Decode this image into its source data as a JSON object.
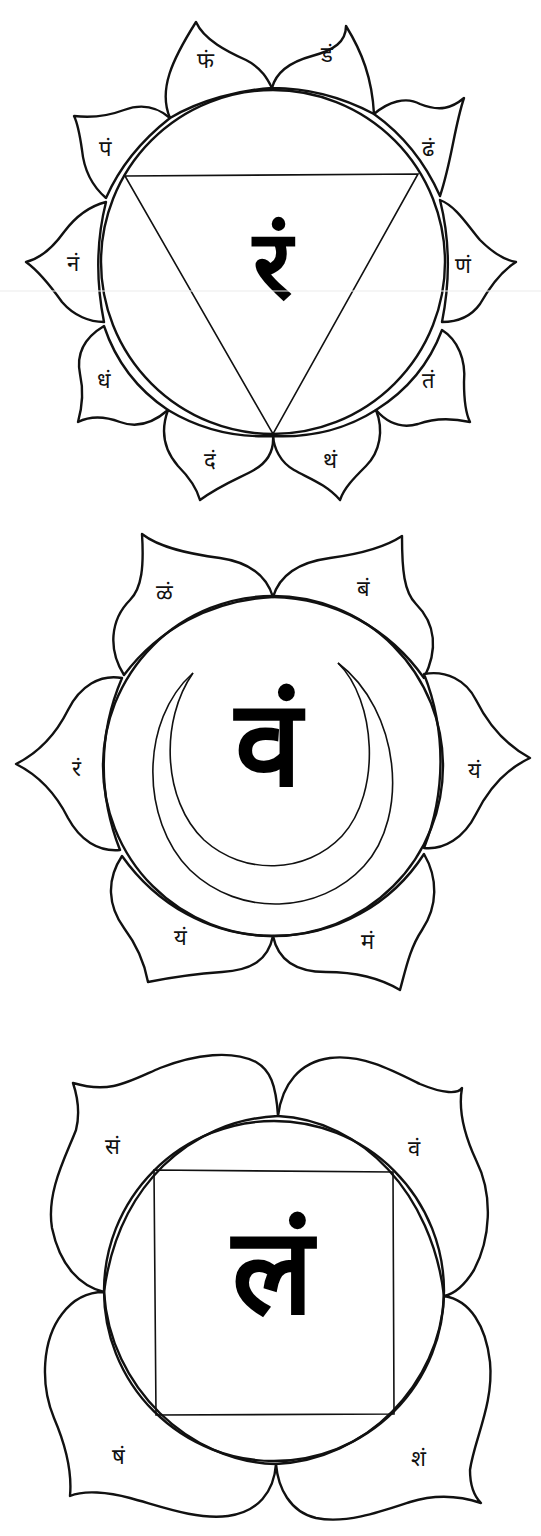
{
  "diagrams": [
    {
      "name": "manipura",
      "petal_count": 10,
      "yantra": "inverted-triangle",
      "bija": "रं",
      "petals": [
        {
          "label": "डं",
          "position": "top-right"
        },
        {
          "label": "ढं",
          "position": "upper-right"
        },
        {
          "label": "णं",
          "position": "right"
        },
        {
          "label": "तं",
          "position": "lower-right"
        },
        {
          "label": "थं",
          "position": "bottom-right"
        },
        {
          "label": "दं",
          "position": "bottom-left"
        },
        {
          "label": "धं",
          "position": "lower-left"
        },
        {
          "label": "नं",
          "position": "left"
        },
        {
          "label": "पं",
          "position": "upper-left"
        },
        {
          "label": "फं",
          "position": "top-left"
        }
      ]
    },
    {
      "name": "svadhisthana",
      "petal_count": 6,
      "yantra": "crescent-moon",
      "bija": "वं",
      "petals": [
        {
          "label": "बं",
          "position": "top-right"
        },
        {
          "label": "यं",
          "position": "right"
        },
        {
          "label": "मं",
          "position": "bottom-right"
        },
        {
          "label": "यं",
          "position": "bottom-left"
        },
        {
          "label": "रं",
          "position": "left"
        },
        {
          "label": "ळं",
          "position": "top-left"
        }
      ]
    },
    {
      "name": "muladhara",
      "petal_count": 4,
      "yantra": "square",
      "bija": "लं",
      "petals": [
        {
          "label": "वं",
          "position": "top-right"
        },
        {
          "label": "शं",
          "position": "bottom-right"
        },
        {
          "label": "षं",
          "position": "bottom-left"
        },
        {
          "label": "सं",
          "position": "top-left"
        }
      ]
    }
  ],
  "colors": {
    "line": "#111111",
    "background": "#ffffff"
  }
}
